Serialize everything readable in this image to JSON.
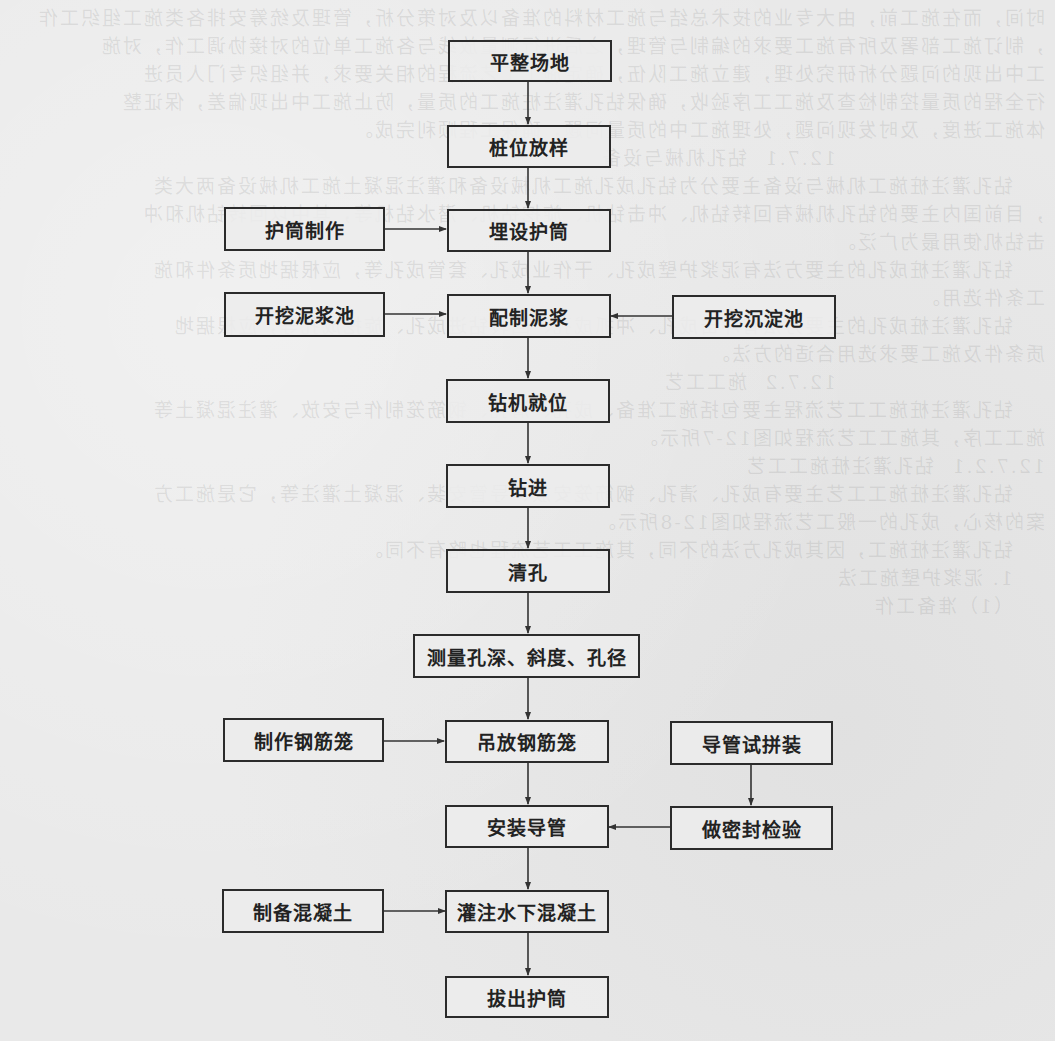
{
  "diagram": {
    "type": "flowchart",
    "background_note": "faint mirrored bleed-through text from reverse page",
    "colors": {
      "background": "#e9e9e9",
      "box_border": "#2b2b2b",
      "text": "#222222",
      "arrow": "#333333"
    },
    "main_flow": [
      {
        "id": "n1",
        "label": "平整场地"
      },
      {
        "id": "n2",
        "label": "桩位放样"
      },
      {
        "id": "n3",
        "label": "埋设护筒"
      },
      {
        "id": "n4",
        "label": "配制泥浆"
      },
      {
        "id": "n5",
        "label": "钻机就位"
      },
      {
        "id": "n6",
        "label": "钻进"
      },
      {
        "id": "n7",
        "label": "清孔"
      },
      {
        "id": "n8",
        "label": "测量孔深、斜度、孔径"
      },
      {
        "id": "n9",
        "label": "吊放钢筋笼"
      },
      {
        "id": "n10",
        "label": "安装导管"
      },
      {
        "id": "n11",
        "label": "灌注水下混凝土"
      },
      {
        "id": "n12",
        "label": "拔出护筒"
      }
    ],
    "side_nodes": [
      {
        "id": "s1",
        "label": "护筒制作",
        "side": "left",
        "target": "n3"
      },
      {
        "id": "s2",
        "label": "开挖泥浆池",
        "side": "left",
        "target": "n4"
      },
      {
        "id": "s3",
        "label": "开挖沉淀池",
        "side": "right",
        "target": "n4"
      },
      {
        "id": "s4",
        "label": "制作钢筋笼",
        "side": "left",
        "target": "n9"
      },
      {
        "id": "s5",
        "label": "导管试拼装",
        "side": "right",
        "target": "s6"
      },
      {
        "id": "s6",
        "label": "做密封检验",
        "side": "right",
        "target": "n10"
      },
      {
        "id": "s7",
        "label": "制备混凝土",
        "side": "left",
        "target": "n11"
      }
    ],
    "edges": [
      [
        "n1",
        "n2"
      ],
      [
        "n2",
        "n3"
      ],
      [
        "n3",
        "n4"
      ],
      [
        "n4",
        "n5"
      ],
      [
        "n5",
        "n6"
      ],
      [
        "n6",
        "n7"
      ],
      [
        "n7",
        "n8"
      ],
      [
        "n8",
        "n9"
      ],
      [
        "n9",
        "n10"
      ],
      [
        "n10",
        "n11"
      ],
      [
        "n11",
        "n12"
      ],
      [
        "s1",
        "n3"
      ],
      [
        "s2",
        "n4"
      ],
      [
        "s3",
        "n4"
      ],
      [
        "s4",
        "n9"
      ],
      [
        "s5",
        "s6"
      ],
      [
        "s6",
        "n10"
      ],
      [
        "s7",
        "n11"
      ]
    ]
  }
}
